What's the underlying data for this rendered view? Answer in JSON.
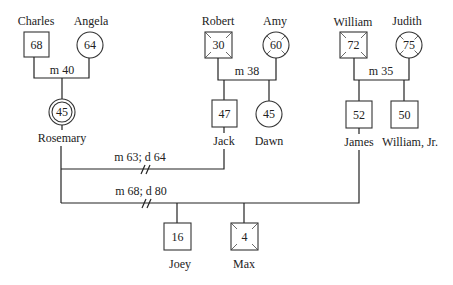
{
  "diagram": {
    "type": "genogram",
    "people": {
      "charles": {
        "name": "Charles",
        "age": "68",
        "sex": "male",
        "deceased": false
      },
      "angela": {
        "name": "Angela",
        "age": "64",
        "sex": "female",
        "deceased": false
      },
      "robert": {
        "name": "Robert",
        "age": "30",
        "sex": "male",
        "deceased": true
      },
      "amy": {
        "name": "Amy",
        "age": "60",
        "sex": "female",
        "deceased": true
      },
      "william": {
        "name": "William",
        "age": "72",
        "sex": "male",
        "deceased": true
      },
      "judith": {
        "name": "Judith",
        "age": "75",
        "sex": "female",
        "deceased": true
      },
      "rosemary": {
        "name": "Rosemary",
        "age": "45",
        "sex": "female",
        "index_person": true
      },
      "jack": {
        "name": "Jack",
        "age": "47",
        "sex": "male",
        "deceased": false
      },
      "dawn": {
        "name": "Dawn",
        "age": "45",
        "sex": "female",
        "deceased": false
      },
      "james": {
        "name": "James",
        "age": "52",
        "sex": "male",
        "deceased": false
      },
      "william_jr": {
        "name": "William, Jr.",
        "age": "50",
        "sex": "male",
        "deceased": false
      },
      "joey": {
        "name": "Joey",
        "age": "16",
        "sex": "male",
        "deceased": false
      },
      "max": {
        "name": "Max",
        "age": "4",
        "sex": "male",
        "deceased": true
      }
    },
    "relationships": {
      "charles_angela": "m 40",
      "robert_amy": "m 38",
      "william_judith": "m 35",
      "rosemary_jack": "m 63; d 64",
      "rosemary_james": "m 68; d 80"
    }
  }
}
